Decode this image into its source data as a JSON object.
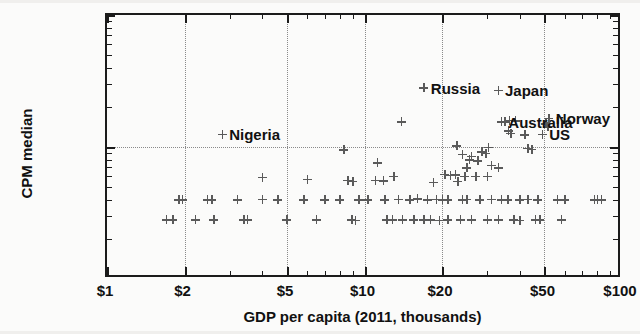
{
  "chart_data": {
    "type": "scatter",
    "title": "",
    "xlabel": "GDP per capita (2011, thousands)",
    "ylabel": "CPM median",
    "xscale": "log",
    "yscale": "log",
    "xlim": [
      1,
      100
    ],
    "ylim": [
      0.01,
      1.0
    ],
    "grid": true,
    "legend": "none",
    "xticks": [
      "$1",
      "$2",
      "$5",
      "$10",
      "$20",
      "$50",
      "$100"
    ],
    "xtick_values": [
      1,
      2,
      5,
      10,
      20,
      50,
      100
    ],
    "yticks": [
      "$1.00",
      "$0.10",
      "$0.01"
    ],
    "ytick_values": [
      1.0,
      0.1,
      0.01
    ],
    "marker_symbol": "plus",
    "marker_color": "#5a5a5a",
    "annotations": [
      {
        "label": "Nigeria",
        "x": 2.8,
        "y": 0.125
      },
      {
        "label": "Russia",
        "x": 17.0,
        "y": 0.28
      },
      {
        "label": "Japan",
        "x": 33.0,
        "y": 0.27
      },
      {
        "label": "Australia",
        "x": 34.0,
        "y": 0.155
      },
      {
        "label": "Norway",
        "x": 52.0,
        "y": 0.165
      },
      {
        "label": "US",
        "x": 49.0,
        "y": 0.125
      }
    ],
    "points": [
      [
        2.8,
        0.125
      ],
      [
        17.0,
        0.28
      ],
      [
        33.0,
        0.27
      ],
      [
        34.0,
        0.155
      ],
      [
        52.0,
        0.165
      ],
      [
        49.0,
        0.125
      ],
      [
        8.3,
        0.095
      ],
      [
        13.9,
        0.155
      ],
      [
        4.0,
        0.059
      ],
      [
        11.2,
        0.076
      ],
      [
        22.8,
        0.102
      ],
      [
        30.2,
        0.1
      ],
      [
        35.0,
        0.155
      ],
      [
        36.5,
        0.16
      ],
      [
        38.5,
        0.158
      ],
      [
        36.2,
        0.133
      ],
      [
        37.0,
        0.127
      ],
      [
        42.0,
        0.124
      ],
      [
        50.5,
        0.15
      ],
      [
        51.5,
        0.142
      ],
      [
        43.0,
        0.098
      ],
      [
        44.5,
        0.096
      ],
      [
        24.0,
        0.088
      ],
      [
        26.0,
        0.085
      ],
      [
        28.5,
        0.092
      ],
      [
        29.5,
        0.09
      ],
      [
        25.5,
        0.08
      ],
      [
        27.5,
        0.079
      ],
      [
        25.0,
        0.07
      ],
      [
        31.0,
        0.073
      ],
      [
        33.0,
        0.07
      ],
      [
        20.5,
        0.062
      ],
      [
        21.5,
        0.061
      ],
      [
        22.5,
        0.0615
      ],
      [
        24.5,
        0.06
      ],
      [
        27.0,
        0.06
      ],
      [
        30.0,
        0.06
      ],
      [
        18.5,
        0.054
      ],
      [
        23.0,
        0.055
      ],
      [
        6.0,
        0.057
      ],
      [
        8.6,
        0.056
      ],
      [
        9.0,
        0.055
      ],
      [
        11.0,
        0.056
      ],
      [
        11.8,
        0.0555
      ],
      [
        13.0,
        0.06
      ],
      [
        15.0,
        0.04
      ],
      [
        16.0,
        0.0405
      ],
      [
        17.5,
        0.04
      ],
      [
        19.0,
        0.0402
      ],
      [
        20.0,
        0.04
      ],
      [
        21.0,
        0.0398
      ],
      [
        12.0,
        0.04
      ],
      [
        13.5,
        0.0402
      ],
      [
        9.5,
        0.04
      ],
      [
        10.3,
        0.0398
      ],
      [
        7.0,
        0.04
      ],
      [
        8.0,
        0.04
      ],
      [
        5.8,
        0.04
      ],
      [
        4.6,
        0.04
      ],
      [
        4.0,
        0.0402
      ],
      [
        3.2,
        0.04
      ],
      [
        2.45,
        0.04
      ],
      [
        2.55,
        0.0398
      ],
      [
        1.9,
        0.04
      ],
      [
        1.96,
        0.0399
      ],
      [
        24.0,
        0.04
      ],
      [
        25.0,
        0.0402
      ],
      [
        28.0,
        0.04
      ],
      [
        31.0,
        0.0401
      ],
      [
        34.0,
        0.04
      ],
      [
        36.0,
        0.04
      ],
      [
        40.0,
        0.04
      ],
      [
        43.0,
        0.0402
      ],
      [
        47.0,
        0.04
      ],
      [
        56.0,
        0.04
      ],
      [
        60.0,
        0.04
      ],
      [
        78.0,
        0.04
      ],
      [
        80.0,
        0.0402
      ],
      [
        83.0,
        0.04
      ],
      [
        3.4,
        0.028
      ],
      [
        3.5,
        0.0282
      ],
      [
        5.0,
        0.028
      ],
      [
        6.5,
        0.028
      ],
      [
        8.9,
        0.028
      ],
      [
        9.2,
        0.0278
      ],
      [
        12.2,
        0.028
      ],
      [
        12.8,
        0.0282
      ],
      [
        14.0,
        0.028
      ],
      [
        15.5,
        0.028
      ],
      [
        17.0,
        0.028
      ],
      [
        18.0,
        0.028
      ],
      [
        19.5,
        0.0278
      ],
      [
        21.0,
        0.028
      ],
      [
        23.5,
        0.028
      ],
      [
        26.0,
        0.028
      ],
      [
        30.0,
        0.028
      ],
      [
        33.0,
        0.028
      ],
      [
        38.0,
        0.028
      ],
      [
        40.0,
        0.0278
      ],
      [
        46.0,
        0.028
      ],
      [
        48.0,
        0.028
      ],
      [
        58.0,
        0.028
      ],
      [
        2.2,
        0.028
      ],
      [
        2.6,
        0.028
      ],
      [
        1.7,
        0.028
      ],
      [
        1.8,
        0.0282
      ],
      [
        1.05,
        0.01
      ],
      [
        1.12,
        0.01
      ],
      [
        1.2,
        0.01
      ],
      [
        1.28,
        0.01
      ],
      [
        1.36,
        0.01
      ],
      [
        1.45,
        0.01
      ],
      [
        1.6,
        0.01
      ],
      [
        1.75,
        0.01
      ],
      [
        1.95,
        0.01
      ],
      [
        2.05,
        0.01
      ],
      [
        2.1,
        0.01
      ],
      [
        2.18,
        0.01
      ],
      [
        2.25,
        0.01
      ],
      [
        2.35,
        0.01
      ],
      [
        2.45,
        0.01
      ],
      [
        2.55,
        0.01
      ],
      [
        2.7,
        0.01
      ],
      [
        2.85,
        0.01
      ],
      [
        3.05,
        0.01
      ],
      [
        3.3,
        0.01
      ],
      [
        3.55,
        0.01
      ],
      [
        3.7,
        0.01
      ],
      [
        3.85,
        0.01
      ],
      [
        4.0,
        0.01
      ],
      [
        4.15,
        0.01
      ],
      [
        4.3,
        0.01
      ],
      [
        4.75,
        0.01
      ],
      [
        5.1,
        0.01
      ],
      [
        5.35,
        0.01
      ],
      [
        5.5,
        0.01
      ],
      [
        5.65,
        0.01
      ],
      [
        5.8,
        0.01
      ],
      [
        6.0,
        0.01
      ],
      [
        6.2,
        0.01
      ],
      [
        6.45,
        0.01
      ],
      [
        6.7,
        0.01
      ],
      [
        6.95,
        0.01
      ],
      [
        7.2,
        0.01
      ],
      [
        7.5,
        0.01
      ],
      [
        7.8,
        0.01
      ],
      [
        8.1,
        0.01
      ],
      [
        8.4,
        0.01
      ],
      [
        8.7,
        0.01
      ],
      [
        9.0,
        0.01
      ],
      [
        9.3,
        0.01
      ],
      [
        9.6,
        0.01
      ],
      [
        9.9,
        0.01
      ],
      [
        10.2,
        0.01
      ],
      [
        10.6,
        0.01
      ],
      [
        11.0,
        0.01
      ],
      [
        11.4,
        0.01
      ],
      [
        11.8,
        0.01
      ],
      [
        12.2,
        0.01
      ],
      [
        12.7,
        0.01
      ],
      [
        13.2,
        0.01
      ],
      [
        13.7,
        0.01
      ],
      [
        14.2,
        0.01
      ],
      [
        14.8,
        0.01
      ],
      [
        15.4,
        0.01
      ],
      [
        16.0,
        0.01
      ],
      [
        16.6,
        0.01
      ],
      [
        17.2,
        0.01
      ],
      [
        17.9,
        0.01
      ],
      [
        18.6,
        0.01
      ],
      [
        19.4,
        0.01
      ],
      [
        20.2,
        0.01
      ],
      [
        21.0,
        0.01
      ],
      [
        22.0,
        0.01
      ],
      [
        24.5,
        0.01
      ],
      [
        25.5,
        0.01
      ],
      [
        26.5,
        0.01
      ],
      [
        27.5,
        0.01
      ],
      [
        29.0,
        0.01
      ],
      [
        31.0,
        0.01
      ],
      [
        32.0,
        0.01
      ],
      [
        35.0,
        0.01
      ],
      [
        36.5,
        0.01
      ],
      [
        39.0,
        0.01
      ],
      [
        45.0,
        0.01
      ]
    ]
  }
}
